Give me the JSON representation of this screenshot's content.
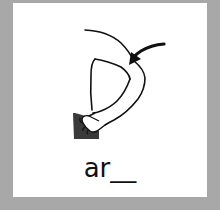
{
  "card": {
    "word_prompt": "ar__",
    "illustration": "arm-with-arrow-pointing-to-upper-arm",
    "colors": {
      "frame": "#a8a8a8",
      "card_background": "#ffffff",
      "ink": "#111111",
      "shadow_block": "#3a3a3a"
    }
  }
}
